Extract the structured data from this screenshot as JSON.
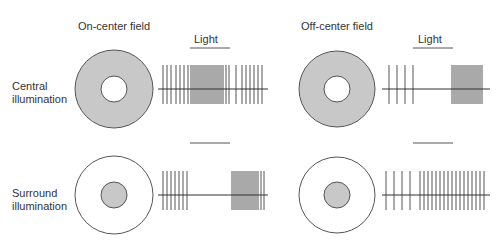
{
  "columns": [
    {
      "title": "On-center field",
      "light_label": "Light"
    },
    {
      "title": "Off-center field",
      "light_label": "Light"
    }
  ],
  "rows": [
    {
      "label_line1": "Central",
      "label_line2": "illumination"
    },
    {
      "label_line1": "Surround",
      "label_line2": "illumination"
    }
  ],
  "colors": {
    "fill": "#c8c8c8",
    "stroke": "#555555",
    "spike": "#555555",
    "text": "#333333"
  },
  "panels": [
    {
      "name": "on-center-central",
      "field": {
        "cx": 114,
        "cy": 89,
        "r_outer": 39,
        "r_inner": 13,
        "shaded": "surround"
      },
      "train": {
        "x0": 158,
        "x1": 268,
        "baseline": 89,
        "top": 65,
        "bottom": 104,
        "spikes": [
          163,
          167,
          171,
          176,
          180,
          184,
          188,
          191,
          193,
          195,
          197,
          199,
          201,
          203,
          205,
          207,
          209,
          211,
          213,
          215,
          217,
          219,
          221,
          223,
          226,
          229,
          236,
          242,
          246,
          250,
          254,
          258,
          262
        ]
      },
      "light_bar": {
        "x0": 190,
        "x1": 230,
        "y": 48
      }
    },
    {
      "name": "off-center-central",
      "field": {
        "cx": 337,
        "cy": 89,
        "r_outer": 38,
        "r_inner": 13,
        "shaded": "surround"
      },
      "train": {
        "x0": 382,
        "x1": 490,
        "baseline": 89,
        "top": 65,
        "bottom": 104,
        "spikes": [
          389,
          397,
          405,
          413,
          452,
          454,
          456,
          458,
          460,
          462,
          464,
          466,
          468,
          470,
          472,
          474,
          476,
          478,
          480,
          482
        ]
      },
      "light_bar": {
        "x0": 413,
        "x1": 453,
        "y": 48
      }
    },
    {
      "name": "on-center-surround",
      "field": {
        "cx": 114,
        "cy": 195,
        "r_outer": 39,
        "r_inner": 13,
        "shaded": "center"
      },
      "train": {
        "x0": 158,
        "x1": 268,
        "baseline": 195,
        "top": 171,
        "bottom": 210,
        "spikes": [
          163,
          167,
          171,
          175,
          179,
          183,
          187,
          232,
          234,
          236,
          238,
          240,
          242,
          244,
          246,
          248,
          250,
          252,
          254,
          256,
          258,
          261,
          264
        ]
      },
      "light_bar": {
        "x0": 190,
        "x1": 230,
        "y": 143
      }
    },
    {
      "name": "off-center-surround",
      "field": {
        "cx": 337,
        "cy": 195,
        "r_outer": 38,
        "r_inner": 13,
        "shaded": "center"
      },
      "train": {
        "x0": 382,
        "x1": 490,
        "baseline": 195,
        "top": 171,
        "bottom": 210,
        "spikes": [
          386,
          394,
          402,
          410,
          420,
          424,
          428,
          432,
          436,
          440,
          444,
          448,
          452,
          456,
          460,
          464,
          468,
          472,
          476,
          480,
          484
        ]
      },
      "light_bar": {
        "x0": 413,
        "x1": 453,
        "y": 143
      }
    }
  ]
}
